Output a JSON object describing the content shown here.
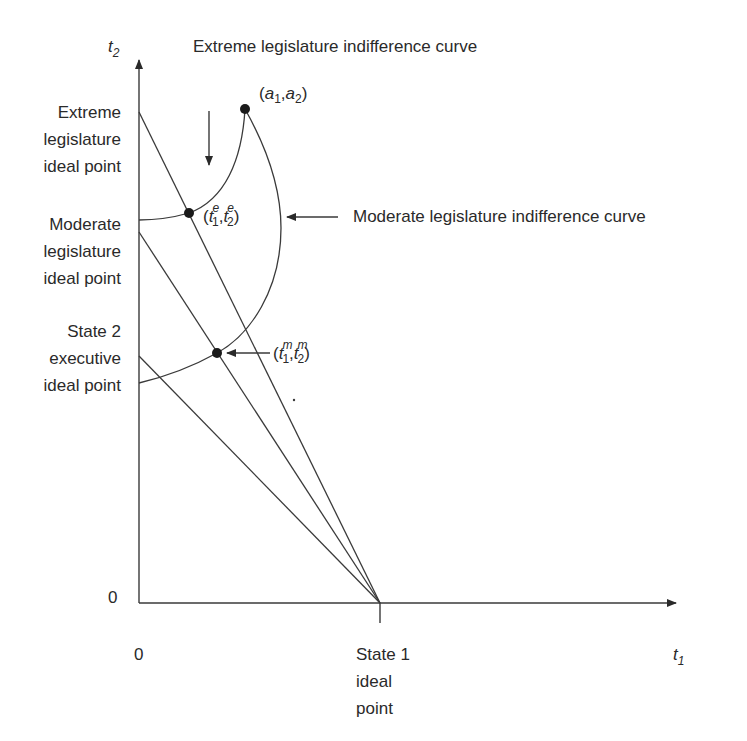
{
  "diagram": {
    "title_label": "Extreme legislature indifference curve",
    "moderate_curve_label": "Moderate legislature indifference curve",
    "axes": {
      "y_axis_label": "t",
      "y_axis_sub": "2",
      "x_axis_label": "t",
      "x_axis_sub": "1",
      "y_origin_label": "0",
      "x_origin_label": "0"
    },
    "y_axis_labels": {
      "extreme": [
        "Extreme",
        "legislature",
        "ideal point"
      ],
      "moderate": [
        "Moderate",
        "legislature",
        "ideal point"
      ],
      "state2": [
        "State 2",
        "executive",
        "ideal point"
      ]
    },
    "x_axis_labels": {
      "state1": [
        "State 1",
        "ideal",
        "point"
      ]
    },
    "points": {
      "a": {
        "open": "(",
        "v1": "a",
        "s1": "1",
        "comma": ",",
        "v2": "a",
        "s2": "2",
        "close": ")"
      },
      "te": {
        "open": "(",
        "v1": "t",
        "sup1": "e",
        "s1": "1",
        "comma": ",",
        "v2": "t",
        "sup2": "e",
        "s2": "2",
        "close": ")"
      },
      "tm": {
        "open": "(",
        "v1": "t",
        "sup1": "m",
        "s1": "1",
        "comma": ",",
        "v2": "t",
        "sup2": "m",
        "s2": "2",
        "close": ")"
      }
    },
    "colors": {
      "ink": "#2a2a2a",
      "line": "#3a3a3a",
      "background": "#ffffff"
    }
  }
}
